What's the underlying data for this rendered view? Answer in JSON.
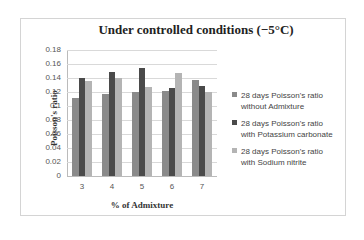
{
  "chart_data": {
    "type": "bar",
    "title": "Under controlled conditions (−5°C)",
    "xlabel": "% of Admixture",
    "ylabel": "Poisson's ratio",
    "categories": [
      "3",
      "4",
      "5",
      "6",
      "7"
    ],
    "ylim": [
      0,
      0.18
    ],
    "yticks": [
      "0",
      "0.02",
      "0.04",
      "0.06",
      "0.08",
      "0.1",
      "0.12",
      "0.14",
      "0.16",
      "0.18"
    ],
    "grid": true,
    "legend_position": "right",
    "series": [
      {
        "name": "28 days Poisson's ratio without Admixture",
        "color": "#8a8a8a",
        "values": [
          0.111,
          0.117,
          0.12,
          0.121,
          0.137
        ]
      },
      {
        "name": "28 days Poisson's ratio with Potassium carbonate",
        "color": "#4a4a4a",
        "values": [
          0.14,
          0.149,
          0.155,
          0.126,
          0.129
        ]
      },
      {
        "name": "28 days Poisson's ratio with Sodium nitrite",
        "color": "#b4b4b4",
        "values": [
          0.136,
          0.14,
          0.127,
          0.147,
          0.12
        ]
      }
    ]
  },
  "legend": [
    {
      "line1": "28 days Poisson's ratio",
      "line2": "without Admixture"
    },
    {
      "line1": "28 days Poisson's ratio",
      "line2": "with Potassium carbonate"
    },
    {
      "line1": "28 days Poisson's ratio",
      "line2": "with Sodium nitrite"
    }
  ]
}
